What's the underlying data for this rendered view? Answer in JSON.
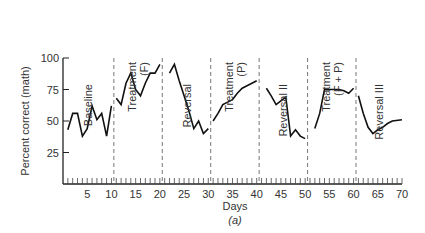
{
  "chart_data": {
    "type": "line",
    "title": "",
    "caption": "(a)",
    "xlabel": "Days",
    "ylabel": "Percent correct (math)",
    "xlim": [
      0,
      70
    ],
    "ylim": [
      0,
      100
    ],
    "x_ticks": [
      5,
      10,
      15,
      20,
      25,
      30,
      35,
      40,
      45,
      50,
      55,
      60,
      65,
      70
    ],
    "y_ticks": [
      25,
      50,
      75,
      100
    ],
    "grid": false,
    "legend": null,
    "phase_dividers": [
      10.5,
      20.5,
      30.5,
      40.5,
      50.5,
      60.5
    ],
    "phases": [
      {
        "name": "Baseline",
        "label_lines": [
          "Baseline"
        ],
        "x": [
          1,
          2,
          3,
          4,
          5,
          6,
          7,
          8,
          9,
          10
        ],
        "values": [
          43,
          56,
          56,
          38,
          44,
          62,
          51,
          56,
          38,
          62
        ]
      },
      {
        "name": "Treatment (F)",
        "label_lines": [
          "Treatment",
          "(F)"
        ],
        "x": [
          11,
          12,
          13,
          14,
          15,
          16,
          17,
          18,
          19,
          20
        ],
        "values": [
          68,
          63,
          80,
          88,
          75,
          70,
          80,
          88,
          88,
          95
        ]
      },
      {
        "name": "Reversal",
        "label_lines": [
          "Reversal"
        ],
        "x": [
          22,
          23,
          24,
          25,
          26,
          27,
          28,
          29,
          30
        ],
        "values": [
          88,
          95,
          82,
          70,
          58,
          44,
          50,
          40,
          44
        ]
      },
      {
        "name": "Treatment (P)",
        "label_lines": [
          "Treatment",
          "(P)"
        ],
        "x": [
          31,
          32,
          33,
          34,
          35,
          36,
          37,
          38,
          39,
          40
        ],
        "values": [
          50,
          56,
          63,
          65,
          67,
          72,
          76,
          78,
          80,
          82
        ]
      },
      {
        "name": "Reversal II",
        "label_lines": [
          "Reversal II"
        ],
        "x": [
          42,
          43,
          44,
          45,
          46,
          47,
          48,
          49,
          50
        ],
        "values": [
          76,
          70,
          63,
          66,
          69,
          38,
          43,
          38,
          36
        ]
      },
      {
        "name": "Treatment (F + P)",
        "label_lines": [
          "Treatment",
          "(F + P)"
        ],
        "x": [
          52,
          53,
          54,
          55,
          56,
          57,
          58,
          59,
          60
        ],
        "values": [
          44,
          56,
          75,
          75,
          75,
          75,
          74,
          72,
          76
        ]
      },
      {
        "name": "Reversal III",
        "label_lines": [
          "Reversal III"
        ],
        "x": [
          61,
          62,
          63,
          64,
          65,
          66,
          67,
          68,
          70
        ],
        "values": [
          70,
          56,
          45,
          40,
          43,
          45,
          48,
          50,
          51
        ]
      }
    ]
  }
}
